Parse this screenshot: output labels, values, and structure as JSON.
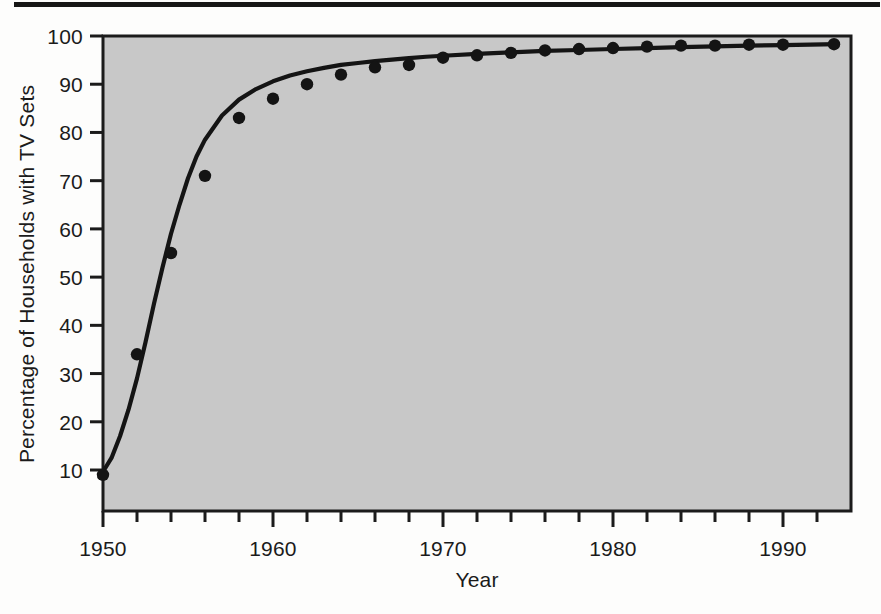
{
  "figure": {
    "background_color": "#fdfdfc",
    "plot_background_color": "#c8c8c8",
    "axis_color": "#1b1b1b",
    "series_color": "#141414",
    "top_rule": "horizontal-rule"
  },
  "chart_data": {
    "type": "scatter",
    "title": "",
    "subtitle": "",
    "xlabel": "Year",
    "ylabel": "Percentage of Households with TV Sets",
    "xlim": [
      1950,
      1994
    ],
    "ylim": [
      1.5,
      100
    ],
    "grid": false,
    "legend": "none",
    "x_tick_labels": [
      "1950",
      "1960",
      "1970",
      "1980",
      "1990"
    ],
    "x_tick_values": [
      1950,
      1960,
      1970,
      1980,
      1990
    ],
    "x_minor_tick_interval": 2,
    "y_tick_labels": [
      "10",
      "20",
      "30",
      "40",
      "50",
      "60",
      "70",
      "80",
      "90",
      "100"
    ],
    "y_tick_values": [
      10,
      20,
      30,
      40,
      50,
      60,
      70,
      80,
      90,
      100
    ],
    "x": [
      1950,
      1952,
      1954,
      1956,
      1958,
      1960,
      1962,
      1964,
      1966,
      1968,
      1970,
      1972,
      1974,
      1976,
      1978,
      1980,
      1982,
      1984,
      1986,
      1988,
      1990,
      1993
    ],
    "values": [
      9,
      34,
      55,
      71,
      83,
      87,
      90,
      92,
      93.5,
      94,
      95.5,
      96,
      96.5,
      97,
      97.3,
      97.5,
      97.8,
      98,
      98,
      98.2,
      98.2,
      98.3
    ],
    "series": [
      {
        "name": "Percentage of Households with TV Sets",
        "marker": "filled-circle",
        "values": [
          9,
          34,
          55,
          71,
          83,
          87,
          90,
          92,
          93.5,
          94,
          95.5,
          96,
          96.5,
          97,
          97.3,
          97.5,
          97.8,
          98,
          98,
          98.2,
          98.2,
          98.3
        ]
      },
      {
        "name": "fitted-logistic-curve",
        "marker": "none",
        "curve_x": [
          1949.8,
          1950.5,
          1951,
          1951.5,
          1952,
          1952.5,
          1953,
          1953.5,
          1954,
          1954.5,
          1955,
          1955.5,
          1956,
          1957,
          1958,
          1959,
          1960,
          1961,
          1962,
          1963,
          1964,
          1965,
          1966,
          1967,
          1968,
          1969,
          1970,
          1972,
          1974,
          1976,
          1978,
          1980,
          1982,
          1984,
          1986,
          1988,
          1990,
          1993.2
        ],
        "curve_y": [
          8.5,
          12.5,
          17,
          22.5,
          29,
          36.5,
          44.5,
          52,
          59,
          65,
          70.5,
          75,
          78.5,
          83.5,
          86.8,
          89,
          90.6,
          91.8,
          92.7,
          93.4,
          94,
          94.4,
          94.8,
          95.1,
          95.4,
          95.7,
          95.9,
          96.3,
          96.6,
          96.9,
          97.1,
          97.3,
          97.5,
          97.7,
          97.85,
          98,
          98.1,
          98.3
        ]
      }
    ]
  }
}
